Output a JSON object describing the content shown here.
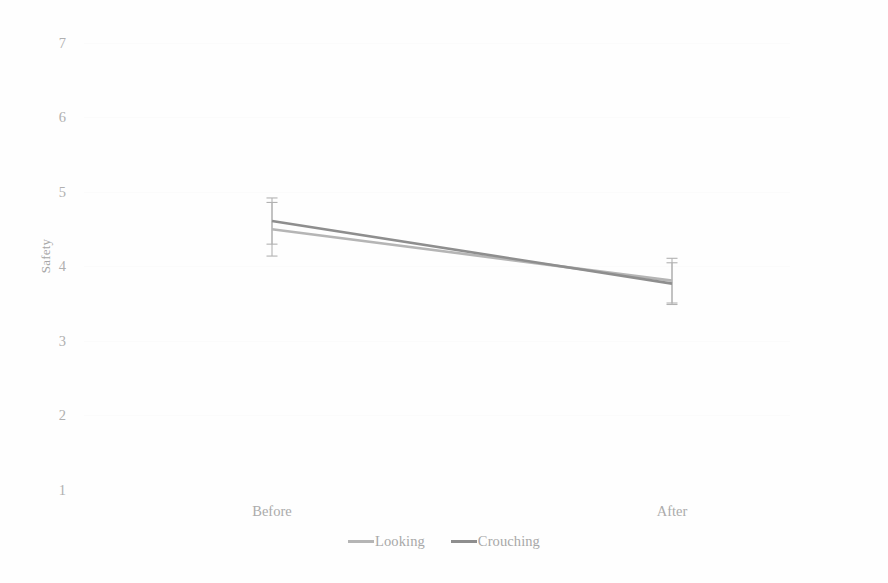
{
  "chart_data": {
    "type": "line",
    "title": "",
    "subtitle": "",
    "xlabel": "",
    "ylabel": "Safety",
    "categories": [
      "Before",
      "After"
    ],
    "ylim": [
      1,
      7
    ],
    "yticks": [
      1,
      2,
      3,
      4,
      5,
      6,
      7
    ],
    "ytick_labels": [
      "1",
      "2",
      "3",
      "4",
      "5",
      "6",
      "7"
    ],
    "grid": false,
    "legend_position": "bottom",
    "series": [
      {
        "name": "Looking",
        "color": "#b5b5b5",
        "values": [
          4.5,
          3.81
        ],
        "errors": [
          0.36,
          0.3
        ],
        "error_low": [
          4.14,
          3.51
        ],
        "error_high": [
          4.86,
          4.11
        ]
      },
      {
        "name": "Crouching",
        "color": "#8e8e8e",
        "values": [
          4.61,
          3.77
        ],
        "errors": [
          0.31,
          0.28
        ],
        "error_low": [
          4.3,
          3.49
        ],
        "error_high": [
          4.92,
          4.05
        ]
      }
    ],
    "annotations": []
  },
  "axes": {
    "y_title": "Safety",
    "y_tick_labels": [
      "7",
      "6",
      "5",
      "4",
      "3",
      "2",
      "1"
    ],
    "x_tick_labels": [
      "Before",
      "After"
    ]
  },
  "legend": {
    "items": [
      {
        "label": "Looking",
        "color": "#b5b5b5"
      },
      {
        "label": "Crouching",
        "color": "#8e8e8e"
      }
    ]
  },
  "colors": {
    "background": "#fefefe",
    "axis_text": "#ababab",
    "series_looking": "#b5b5b5",
    "series_crouching": "#8e8e8e",
    "error_bar": "#b2b2b2"
  }
}
